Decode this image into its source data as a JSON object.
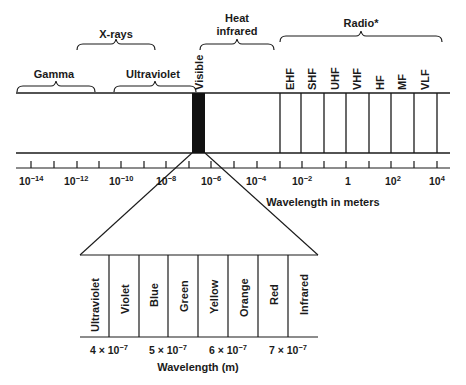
{
  "diagram": {
    "type": "electromagnetic-spectrum",
    "top_labels": {
      "gamma": "Gamma",
      "xrays": "X-rays",
      "ultraviolet": "Ultraviolet",
      "visible": "Visible",
      "heat_infrared_line1": "Heat",
      "heat_infrared_line2": "infrared",
      "radio": "Radio*"
    },
    "radio_bands": [
      "EHF",
      "SHF",
      "UHF",
      "VHF",
      "HF",
      "MF",
      "VLF"
    ],
    "axis": {
      "label": "Wavelength in meters",
      "ticks": [
        {
          "base": "10",
          "exp": "−14"
        },
        {
          "base": "10",
          "exp": "−12"
        },
        {
          "base": "10",
          "exp": "−10"
        },
        {
          "base": "10",
          "exp": "−8"
        },
        {
          "base": "10",
          "exp": "−6"
        },
        {
          "base": "10",
          "exp": "−4"
        },
        {
          "base": "10",
          "exp": "−2"
        },
        {
          "base": "1",
          "exp": ""
        },
        {
          "base": "10",
          "exp": "2"
        },
        {
          "base": "10",
          "exp": "4"
        }
      ]
    },
    "visible_detail": {
      "bands": [
        "Ultraviolet",
        "Violet",
        "Blue",
        "Green",
        "Yellow",
        "Orange",
        "Red",
        "Infrared"
      ],
      "ticks": [
        {
          "coef": "4 × 10",
          "exp": "−7"
        },
        {
          "coef": "5 × 10",
          "exp": "−7"
        },
        {
          "coef": "6 × 10",
          "exp": "−7"
        },
        {
          "coef": "7 × 10",
          "exp": "−7"
        }
      ],
      "axis_label": "Wavelength (m)"
    },
    "colors": {
      "ink": "#1a1a1a",
      "visible_band": "#111111",
      "background": "#ffffff"
    }
  }
}
